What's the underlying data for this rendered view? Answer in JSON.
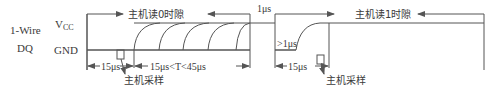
{
  "labels": {
    "wire_line1": "1-Wire",
    "wire_line2": "DQ",
    "vcc_main": "V",
    "vcc_sub": "CC",
    "gnd": "GND"
  },
  "read0": {
    "title": "主机读0时隙",
    "duration_first": "15μs",
    "duration_window": "15μs<T<45μs",
    "sample_label": "主机采样"
  },
  "recovery": {
    "gap": "1μs"
  },
  "read1": {
    "title": "主机读1时隙",
    "low_min": ">1μs",
    "duration_first": "15μs",
    "sample_label": "主机采样"
  },
  "colors": {
    "line": "#555555",
    "text": "#3a3a3a"
  }
}
